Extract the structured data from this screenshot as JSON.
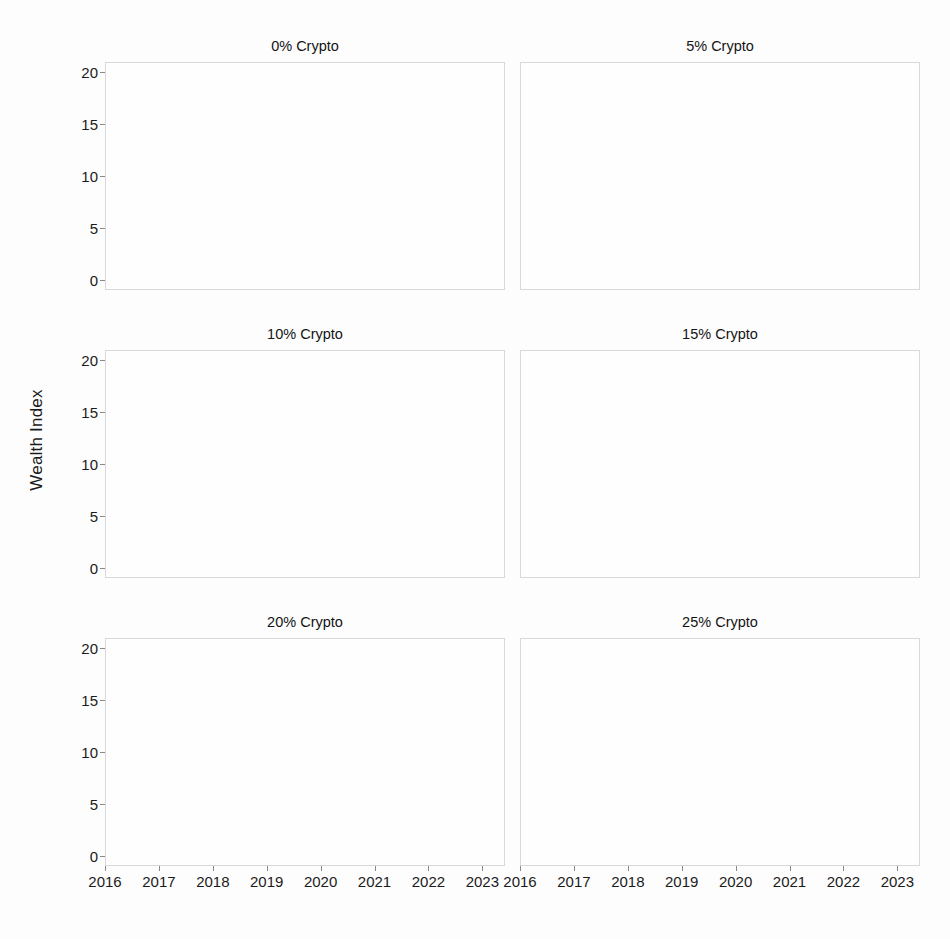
{
  "figure": {
    "ylabel": "Wealth Index",
    "line_color": "#111111",
    "grid_major_color": "#e3e3e3",
    "grid_minor_color": "#ededed",
    "frame_color": "#d8d8d8",
    "background": "#fdfdfd"
  },
  "chart_data": {
    "type": "line",
    "title": "",
    "xlabel": "",
    "ylabel": "Wealth Index",
    "xlim": [
      2016.0,
      2023.42
    ],
    "ylim": [
      -1.0,
      21.0
    ],
    "ytick_labels": [
      "0",
      "5",
      "10",
      "15",
      "20"
    ],
    "ytick_values": [
      0,
      5,
      10,
      15,
      20
    ],
    "xtick_labels": [
      "2016",
      "2017",
      "2018",
      "2019",
      "2020",
      "2021",
      "2022",
      "2023"
    ],
    "xtick_values": [
      2016,
      2017,
      2018,
      2019,
      2020,
      2021,
      2022,
      2023
    ],
    "grid": true,
    "legend": "none",
    "x": [
      2016.0,
      2016.08,
      2016.17,
      2016.25,
      2016.33,
      2016.42,
      2016.5,
      2016.58,
      2016.67,
      2016.75,
      2016.83,
      2016.92,
      2017.0,
      2017.08,
      2017.17,
      2017.25,
      2017.33,
      2017.42,
      2017.5,
      2017.58,
      2017.67,
      2017.75,
      2017.83,
      2017.92,
      2018.0,
      2018.08,
      2018.17,
      2018.25,
      2018.33,
      2018.42,
      2018.5,
      2018.58,
      2018.67,
      2018.75,
      2018.83,
      2018.92,
      2019.0,
      2019.08,
      2019.17,
      2019.25,
      2019.33,
      2019.42,
      2019.5,
      2019.58,
      2019.67,
      2019.75,
      2019.83,
      2019.92,
      2020.0,
      2020.08,
      2020.17,
      2020.25,
      2020.33,
      2020.42,
      2020.5,
      2020.58,
      2020.67,
      2020.75,
      2020.83,
      2020.92,
      2021.0,
      2021.08,
      2021.17,
      2021.25,
      2021.33,
      2021.42,
      2021.5,
      2021.58,
      2021.67,
      2021.75,
      2021.83,
      2021.92,
      2022.0,
      2022.08,
      2022.17,
      2022.25,
      2022.33,
      2022.42,
      2022.5,
      2022.58,
      2022.67,
      2022.75,
      2022.83,
      2022.92,
      2023.0,
      2023.08,
      2023.17,
      2023.25,
      2023.33,
      2023.42
    ],
    "panels": [
      {
        "title": "0% Crypto",
        "crypto_weight_pct": 0,
        "values": [
          1.0,
          1.01,
          1.03,
          1.05,
          1.07,
          1.08,
          1.1,
          1.11,
          1.12,
          1.12,
          1.13,
          1.16,
          1.19,
          1.21,
          1.22,
          1.23,
          1.25,
          1.26,
          1.26,
          1.27,
          1.26,
          1.28,
          1.29,
          1.3,
          1.31,
          1.28,
          1.27,
          1.28,
          1.29,
          1.28,
          1.29,
          1.3,
          1.29,
          1.26,
          1.22,
          1.2,
          1.24,
          1.26,
          1.28,
          1.3,
          1.31,
          1.32,
          1.33,
          1.33,
          1.34,
          1.35,
          1.37,
          1.38,
          1.4,
          1.4,
          1.24,
          1.3,
          1.35,
          1.38,
          1.41,
          1.43,
          1.44,
          1.45,
          1.48,
          1.52,
          1.55,
          1.57,
          1.59,
          1.6,
          1.61,
          1.62,
          1.63,
          1.64,
          1.65,
          1.66,
          1.66,
          1.67,
          1.66,
          1.62,
          1.58,
          1.55,
          1.5,
          1.46,
          1.48,
          1.46,
          1.44,
          1.45,
          1.46,
          1.44,
          1.47,
          1.49,
          1.48,
          1.5,
          1.51,
          1.52
        ]
      },
      {
        "title": "5% Crypto",
        "crypto_weight_pct": 5,
        "values": [
          1.12,
          1.14,
          1.17,
          1.2,
          1.23,
          1.25,
          1.27,
          1.29,
          1.31,
          1.33,
          1.36,
          1.42,
          1.5,
          1.58,
          1.66,
          1.74,
          1.82,
          1.88,
          1.92,
          1.95,
          1.96,
          1.99,
          2.04,
          2.08,
          2.1,
          2.05,
          2.03,
          2.04,
          2.06,
          2.05,
          2.06,
          2.08,
          2.06,
          2.02,
          1.96,
          1.93,
          1.98,
          2.02,
          2.06,
          2.1,
          2.13,
          2.14,
          2.16,
          2.16,
          2.18,
          2.2,
          2.22,
          2.24,
          2.28,
          2.28,
          2.02,
          2.12,
          2.2,
          2.26,
          2.31,
          2.35,
          2.37,
          2.4,
          2.46,
          2.55,
          2.62,
          2.68,
          2.73,
          2.77,
          2.8,
          2.83,
          2.86,
          2.89,
          2.92,
          2.95,
          2.96,
          2.98,
          2.95,
          2.86,
          2.78,
          2.7,
          2.6,
          2.52,
          2.56,
          2.5,
          2.46,
          2.49,
          2.52,
          2.48,
          2.56,
          2.62,
          2.58,
          2.62,
          2.65,
          2.68
        ]
      },
      {
        "title": "10% Crypto",
        "crypto_weight_pct": 10,
        "values": [
          1.05,
          1.08,
          1.12,
          1.16,
          1.2,
          1.22,
          1.25,
          1.27,
          1.29,
          1.31,
          1.35,
          1.5,
          1.72,
          1.95,
          2.15,
          2.35,
          2.55,
          2.7,
          2.8,
          2.85,
          2.83,
          2.88,
          2.95,
          2.92,
          2.88,
          2.78,
          2.72,
          2.74,
          2.78,
          2.75,
          2.72,
          2.7,
          2.66,
          2.58,
          2.48,
          2.44,
          2.55,
          2.65,
          2.75,
          2.84,
          2.88,
          2.86,
          2.88,
          2.86,
          2.88,
          2.9,
          2.92,
          2.94,
          3.0,
          2.98,
          2.52,
          2.72,
          2.88,
          3.0,
          3.1,
          3.18,
          3.22,
          3.3,
          3.45,
          3.7,
          3.92,
          4.12,
          4.28,
          4.42,
          4.55,
          4.62,
          4.68,
          4.72,
          4.8,
          4.92,
          5.02,
          5.08,
          4.98,
          4.78,
          4.58,
          4.42,
          4.22,
          4.05,
          4.12,
          3.95,
          3.88,
          3.95,
          4.02,
          3.92,
          4.05,
          4.12,
          4.05,
          4.1,
          4.14,
          4.18
        ]
      },
      {
        "title": "15% Crypto",
        "crypto_weight_pct": 15,
        "values": [
          1.08,
          1.12,
          1.18,
          1.24,
          1.28,
          1.31,
          1.34,
          1.36,
          1.38,
          1.41,
          1.48,
          1.72,
          2.1,
          2.5,
          2.85,
          3.2,
          3.55,
          3.85,
          4.05,
          4.15,
          4.1,
          4.2,
          4.35,
          4.28,
          4.18,
          3.98,
          3.86,
          3.9,
          3.98,
          3.92,
          3.86,
          3.82,
          3.74,
          3.58,
          3.42,
          3.36,
          3.58,
          3.78,
          3.98,
          4.15,
          4.22,
          4.18,
          4.22,
          4.18,
          4.22,
          4.26,
          4.3,
          4.36,
          4.48,
          4.44,
          3.62,
          3.98,
          4.28,
          4.5,
          4.68,
          4.82,
          4.9,
          5.05,
          5.35,
          5.85,
          6.3,
          6.72,
          7.05,
          7.35,
          7.62,
          7.78,
          7.9,
          7.98,
          8.15,
          8.35,
          8.45,
          8.3,
          8.05,
          7.62,
          7.2,
          6.85,
          6.45,
          6.12,
          6.25,
          5.95,
          5.82,
          5.98,
          6.12,
          5.92,
          6.18,
          6.32,
          6.2,
          6.28,
          6.36,
          6.45
        ]
      },
      {
        "title": "20% Crypto",
        "crypto_weight_pct": 20,
        "values": [
          1.02,
          1.08,
          1.16,
          1.22,
          1.28,
          1.32,
          1.35,
          1.38,
          1.4,
          1.42,
          1.52,
          1.95,
          2.6,
          3.3,
          3.85,
          4.35,
          4.9,
          5.5,
          5.95,
          6.15,
          5.85,
          6.0,
          6.1,
          5.85,
          5.62,
          5.35,
          5.18,
          5.28,
          5.45,
          5.32,
          5.18,
          5.05,
          4.88,
          4.62,
          4.42,
          4.38,
          4.62,
          4.88,
          5.2,
          5.55,
          5.62,
          5.48,
          5.52,
          5.45,
          5.52,
          5.58,
          5.62,
          5.7,
          5.98,
          5.88,
          4.65,
          5.15,
          5.55,
          5.88,
          6.15,
          6.35,
          6.48,
          6.72,
          7.25,
          8.25,
          9.15,
          9.95,
          10.55,
          11.1,
          11.55,
          11.9,
          11.4,
          10.65,
          11.2,
          11.8,
          12.35,
          12.6,
          12.2,
          11.4,
          10.7,
          10.25,
          9.7,
          9.25,
          9.55,
          8.85,
          8.6,
          8.92,
          9.15,
          8.8,
          9.25,
          9.5,
          9.28,
          9.42,
          9.58,
          9.72
        ]
      },
      {
        "title": "25% Crypto",
        "crypto_weight_pct": 25,
        "values": [
          1.05,
          1.12,
          1.22,
          1.3,
          1.36,
          1.4,
          1.43,
          1.45,
          1.48,
          1.5,
          1.65,
          2.3,
          3.35,
          4.45,
          5.25,
          5.95,
          6.85,
          7.85,
          8.6,
          8.95,
          8.25,
          8.5,
          8.65,
          8.15,
          7.75,
          7.25,
          6.95,
          7.15,
          7.45,
          7.25,
          7.0,
          6.8,
          6.5,
          6.1,
          5.85,
          5.8,
          6.2,
          6.65,
          7.15,
          7.75,
          7.85,
          7.55,
          7.62,
          7.48,
          7.58,
          7.68,
          7.75,
          7.88,
          8.4,
          8.25,
          6.15,
          7.0,
          7.65,
          8.15,
          8.6,
          8.95,
          9.2,
          9.65,
          10.6,
          12.4,
          14.0,
          15.4,
          16.4,
          17.3,
          18.1,
          18.65,
          17.3,
          15.9,
          17.2,
          18.4,
          19.3,
          18.7,
          17.9,
          16.4,
          15.2,
          14.45,
          13.5,
          12.75,
          13.4,
          12.1,
          11.7,
          12.25,
          12.65,
          12.05,
          12.85,
          13.3,
          12.95,
          13.2,
          13.55,
          13.85
        ]
      }
    ]
  }
}
